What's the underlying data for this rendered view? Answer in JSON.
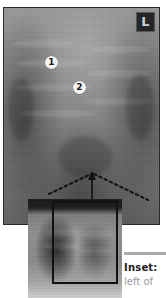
{
  "figure": {
    "main_image": {
      "name": "chest-radiograph-magnified",
      "side_marker": "L",
      "callouts": [
        {
          "id": "1",
          "label": "1"
        },
        {
          "id": "2",
          "label": "2"
        }
      ],
      "annotations": {
        "arrow": "upward-arrow-marker",
        "dashed_lines": "inverted-v-dashed-guide"
      }
    },
    "inset_image": {
      "name": "chest-radiograph-full",
      "roi_label": "region-of-interest-rectangle"
    }
  },
  "caption": {
    "lead": "Inset:",
    "body": "left of"
  },
  "colors": {
    "frame_border": "#2a2a2a",
    "marker_bg": "#24262a",
    "marker_fg": "#c9ccd0",
    "callout_bg": "#f4f4f2",
    "callout_fg": "#1b1b1b",
    "rule": "#a8a9ab",
    "caption_lead": "#1d1d1d",
    "caption_body": "#9a9b9d",
    "roi_border": "#111111"
  }
}
